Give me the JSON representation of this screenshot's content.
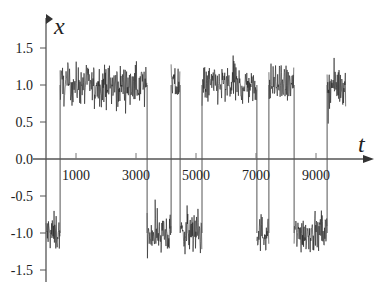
{
  "chart_data": {
    "type": "line",
    "title": "",
    "xlabel": "t",
    "ylabel": "x",
    "xlim": [
      0,
      10500
    ],
    "ylim": [
      -1.7,
      1.9
    ],
    "grid": false,
    "legend": null,
    "x_ticks": [
      1000,
      3000,
      5000,
      7000,
      9000
    ],
    "x_tick_labels": [
      "1000",
      "3000",
      "5000",
      "7000",
      "9000"
    ],
    "y_ticks": [
      1.5,
      1.0,
      0.5,
      0.0,
      -0.5,
      -1.0,
      -1.5
    ],
    "y_tick_labels": [
      "1.5",
      "1.0",
      "0.5",
      "0.0",
      "-0.5",
      "-1.0",
      "-1.5"
    ],
    "series": [
      {
        "name": "x(t)",
        "segments": [
          {
            "t_start": 0,
            "t_end": 470,
            "level": -1.0
          },
          {
            "t_start": 470,
            "t_end": 3370,
            "level": 1.0
          },
          {
            "t_start": 3370,
            "t_end": 4170,
            "level": -1.0
          },
          {
            "t_start": 4170,
            "t_end": 4470,
            "level": 1.0
          },
          {
            "t_start": 4470,
            "t_end": 5200,
            "level": -1.0
          },
          {
            "t_start": 5200,
            "t_end": 7030,
            "level": 1.0
          },
          {
            "t_start": 7030,
            "t_end": 7430,
            "level": -1.0
          },
          {
            "t_start": 7430,
            "t_end": 8270,
            "level": 1.0
          },
          {
            "t_start": 8270,
            "t_end": 9370,
            "level": -1.0
          },
          {
            "t_start": 9370,
            "t_end": 10000,
            "level": 1.0
          }
        ],
        "noise_amplitude": 0.3
      }
    ]
  },
  "axes": {
    "x_label": "t",
    "y_label": "x"
  }
}
